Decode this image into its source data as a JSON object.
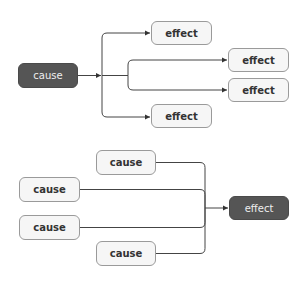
{
  "diagrams": [
    {
      "name": "one-cause-many-effects",
      "source": {
        "label": "cause",
        "style": "dark"
      },
      "targets": [
        {
          "label": "effect",
          "style": "light"
        },
        {
          "label": "effect",
          "style": "light"
        },
        {
          "label": "effect",
          "style": "light"
        },
        {
          "label": "effect",
          "style": "light"
        }
      ]
    },
    {
      "name": "many-causes-one-effect",
      "sources": [
        {
          "label": "cause",
          "style": "light"
        },
        {
          "label": "cause",
          "style": "light"
        },
        {
          "label": "cause",
          "style": "light"
        },
        {
          "label": "cause",
          "style": "light"
        }
      ],
      "target": {
        "label": "effect",
        "style": "dark"
      }
    }
  ],
  "colors": {
    "dark_fill": "#555555",
    "light_fill": "#f6f6f6",
    "border": "#9a9a9a",
    "connector": "#444444"
  }
}
